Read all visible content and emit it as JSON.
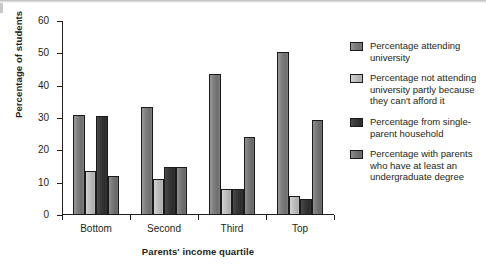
{
  "chart_data": {
    "type": "bar",
    "title": "",
    "subtitle": "",
    "xlabel": "Parents' income quartile",
    "ylabel": "Percentage of students",
    "categories": [
      "Bottom",
      "Second",
      "Third",
      "Top"
    ],
    "ylim": [
      0,
      60
    ],
    "yticks": [
      0,
      10,
      20,
      30,
      40,
      50,
      60
    ],
    "grid": false,
    "legend_position": "right",
    "series": [
      {
        "name": "Percentage attending university",
        "color": "#828282",
        "values": [
          31,
          33.5,
          43.5,
          50.5
        ]
      },
      {
        "name": "Percentage not attending university partly because they can't afford it",
        "color": "#c2c2c2",
        "values": [
          13.5,
          11,
          8,
          6
        ]
      },
      {
        "name": "Percentage from single-parent household",
        "color": "#3a3a3a",
        "values": [
          30.5,
          15,
          8,
          5
        ]
      },
      {
        "name": "Percentage with parents who have at least an undergraduate degree",
        "color": "#7a7a7a",
        "values": [
          12,
          15,
          24,
          29.5
        ]
      }
    ]
  },
  "axis": {
    "y_tick_labels": [
      "0",
      "10",
      "20",
      "30",
      "40",
      "50",
      "60"
    ],
    "x_tick_labels": [
      "Bottom",
      "Second",
      "Third",
      "Top"
    ],
    "y_title": "Percentage of students",
    "x_title": "Parents' income quartile"
  },
  "legend": {
    "items": [
      {
        "label": "Percentage attending university",
        "color": "#828282"
      },
      {
        "label": "Percentage not attending university partly because they can't afford it",
        "color": "#c2c2c2"
      },
      {
        "label": "Percentage from single-parent household",
        "color": "#3a3a3a"
      },
      {
        "label": "Percentage with parents who have at least an undergraduate degree",
        "color": "#7a7a7a"
      }
    ]
  }
}
